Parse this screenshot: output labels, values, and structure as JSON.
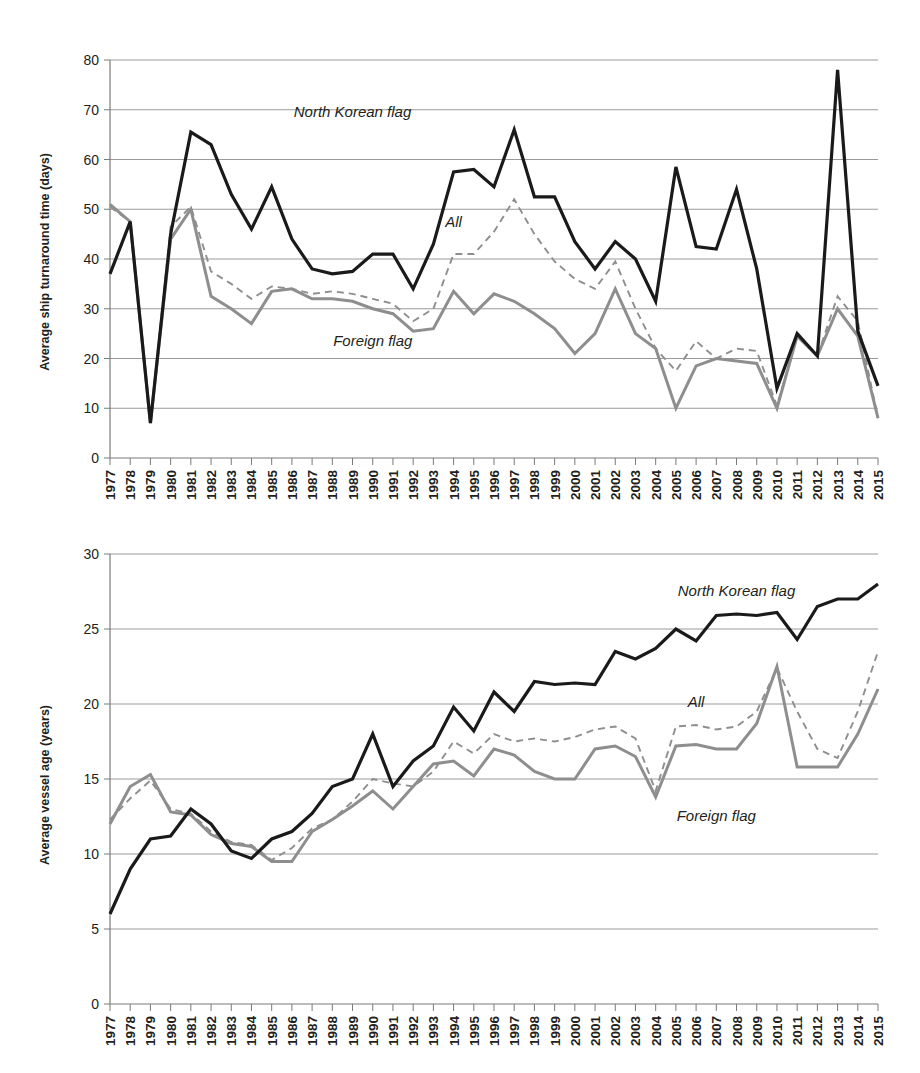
{
  "chart_data": [
    {
      "type": "line",
      "id": "ship-turnaround-time",
      "title": "",
      "xlabel": "",
      "ylabel": "Average ship turnaround time (days)",
      "ylim": [
        0,
        80
      ],
      "ytick_step": 10,
      "yticks": [
        0,
        10,
        20,
        30,
        40,
        50,
        60,
        70,
        80
      ],
      "grid": true,
      "legend_position": "inline-annotations",
      "categories": [
        "1977",
        "1978",
        "1979",
        "1980",
        "1981",
        "1982",
        "1983",
        "1984",
        "1985",
        "1986",
        "1987",
        "1988",
        "1989",
        "1990",
        "1991",
        "1992",
        "1993",
        "1994",
        "1995",
        "1996",
        "1997",
        "1998",
        "1999",
        "2000",
        "2001",
        "2002",
        "2003",
        "2004",
        "2005",
        "2006",
        "2007",
        "2008",
        "2009",
        "2010",
        "2011",
        "2012",
        "2013",
        "2014",
        "2015"
      ],
      "series": [
        {
          "name": "North Korean flag",
          "style": "solid-black",
          "color": "#1a1a1a",
          "values": [
            37,
            47.5,
            7,
            45,
            65.5,
            63,
            53,
            46,
            54.5,
            44,
            38,
            37,
            37.5,
            41,
            41,
            34,
            43,
            57.5,
            58,
            54.5,
            66,
            52.5,
            52.5,
            43.5,
            38,
            43.5,
            40,
            31.5,
            58.5,
            42.5,
            42,
            54,
            38,
            14,
            25,
            20.5,
            78,
            25.5,
            14.5
          ]
        },
        {
          "name": "All",
          "style": "dashed-gray",
          "color": "#8e8e8e",
          "values": [
            50.5,
            47.5,
            7,
            46.5,
            50.5,
            37.5,
            35,
            32,
            34.5,
            34,
            33,
            33.5,
            33,
            32,
            31,
            27.5,
            30,
            41,
            41,
            45.5,
            52,
            45,
            39.5,
            36,
            34,
            39.5,
            30,
            22,
            17.5,
            23.5,
            20,
            22,
            21.5,
            10.5,
            24.5,
            20.5,
            32.5,
            27.5,
            8
          ]
        },
        {
          "name": "Foreign flag",
          "style": "solid-gray",
          "color": "#8e8e8e",
          "values": [
            51,
            47.5,
            7,
            44,
            50,
            32.5,
            30,
            27,
            33.5,
            34,
            32,
            32,
            31.5,
            30,
            29,
            25.5,
            26,
            33.5,
            29,
            33,
            31.5,
            29,
            26,
            21,
            25,
            34,
            25,
            22,
            10,
            18.5,
            20,
            19.5,
            19,
            10,
            24.5,
            20.5,
            30,
            24.5,
            8
          ]
        }
      ],
      "annotations": [
        {
          "text": "North Korean flag",
          "x": "1989",
          "y": 68.5
        },
        {
          "text": "All",
          "x": "1994",
          "y": 46.5
        },
        {
          "text": "Foreign flag",
          "x": "1990",
          "y": 22.5
        }
      ]
    },
    {
      "type": "line",
      "id": "average-vessel-age",
      "title": "",
      "xlabel": "",
      "ylabel": "Average vessel age (years)",
      "ylim": [
        0,
        30
      ],
      "ytick_step": 5,
      "yticks": [
        0,
        5,
        10,
        15,
        20,
        25,
        30
      ],
      "grid": true,
      "legend_position": "inline-annotations",
      "categories": [
        "1977",
        "1978",
        "1979",
        "1980",
        "1981",
        "1982",
        "1983",
        "1984",
        "1985",
        "1986",
        "1987",
        "1988",
        "1989",
        "1990",
        "1991",
        "1992",
        "1993",
        "1994",
        "1995",
        "1996",
        "1997",
        "1998",
        "1999",
        "2000",
        "2001",
        "2002",
        "2003",
        "2004",
        "2005",
        "2006",
        "2007",
        "2008",
        "2009",
        "2010",
        "2011",
        "2012",
        "2013",
        "2014",
        "2015"
      ],
      "series": [
        {
          "name": "North Korean flag",
          "style": "solid-black",
          "color": "#1a1a1a",
          "values": [
            6,
            9,
            11,
            11.2,
            13,
            12,
            10.2,
            9.7,
            11,
            11.5,
            12.7,
            14.5,
            15,
            18,
            14.5,
            16.2,
            17.2,
            19.8,
            18.2,
            20.8,
            19.5,
            21.5,
            21.3,
            21.4,
            21.3,
            23.5,
            23,
            23.7,
            25,
            24.2,
            25.9,
            26,
            25.9,
            26.1,
            24.3,
            26.5,
            27,
            27,
            28
          ]
        },
        {
          "name": "All",
          "style": "dashed-gray",
          "color": "#8e8e8e",
          "values": [
            12.3,
            13.7,
            14.9,
            13,
            12.7,
            11.5,
            10.8,
            10.6,
            9.6,
            10.4,
            11.7,
            12.3,
            13.5,
            15,
            14.7,
            14.5,
            15.5,
            17.5,
            16.7,
            18,
            17.5,
            17.7,
            17.5,
            17.8,
            18.3,
            18.5,
            17.7,
            14.2,
            18.5,
            18.6,
            18.3,
            18.5,
            19.5,
            22.4,
            19.5,
            17,
            16.4,
            19.5,
            23.5
          ]
        },
        {
          "name": "Foreign flag",
          "style": "solid-gray",
          "color": "#8e8e8e",
          "values": [
            12,
            14.5,
            15.3,
            12.8,
            12.6,
            11.3,
            10.7,
            10.5,
            9.5,
            9.5,
            11.5,
            12.3,
            13.2,
            14.2,
            13,
            14.5,
            16,
            16.2,
            15.2,
            17,
            16.6,
            15.5,
            15,
            15,
            17,
            17.2,
            16.5,
            13.8,
            17.2,
            17.3,
            17,
            17,
            18.7,
            22.5,
            15.8,
            15.8,
            15.8,
            18,
            21
          ]
        }
      ],
      "annotations": [
        {
          "text": "North Korean flag",
          "x": "2008",
          "y": 27.2
        },
        {
          "text": "All",
          "x": "2006",
          "y": 19.8
        },
        {
          "text": "Foreign flag",
          "x": "2007",
          "y": 12.2
        }
      ]
    }
  ]
}
